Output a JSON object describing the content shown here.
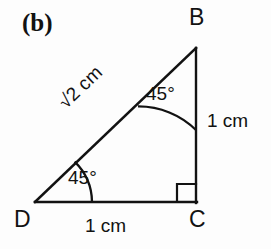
{
  "figure": {
    "part_label": "(b)",
    "background_color": "#fdfdfd",
    "stroke_color": "#121212",
    "vertices": {
      "b": "B",
      "c": "C",
      "d": "D"
    },
    "angles": {
      "at_b": "45°",
      "at_d": "45°",
      "at_c": "right-angle-marker"
    },
    "sides": {
      "hypotenuse": "√2 cm",
      "hypotenuse_radical": "√",
      "hypotenuse_value": "2 cm",
      "vertical_bc": "1 cm",
      "base_dc": "1 cm"
    }
  }
}
